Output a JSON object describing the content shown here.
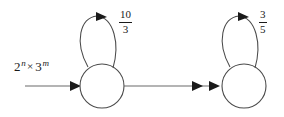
{
  "diagram": {
    "type": "state-transition-diagram",
    "background_color": "#ffffff",
    "stroke_color": "#3a3a3a",
    "text_color": "#1a1a1a",
    "input": {
      "label_base_1": "2",
      "label_sup_1": "n",
      "label_times": "×",
      "label_base_2": "3",
      "label_sup_2": "m",
      "label_plain": "2^n × 3^m"
    },
    "states": [
      {
        "id": "state-left",
        "label": "",
        "cx": 102,
        "cy": 86,
        "r": 22,
        "self_loop_label_numerator": "10",
        "self_loop_label_denominator": "3",
        "self_loop_label_plain": "10/3"
      },
      {
        "id": "state-right",
        "label": "",
        "cx": 244,
        "cy": 86,
        "r": 22,
        "self_loop_label_numerator": "3",
        "self_loop_label_denominator": "5",
        "self_loop_label_plain": "3/5"
      }
    ],
    "edges": [
      {
        "id": "edge-input",
        "from": "",
        "to": "state-left",
        "label": "2^n × 3^m",
        "arrowheads": 1
      },
      {
        "id": "edge-left-to-right",
        "from": "state-left",
        "to": "state-right",
        "label": "",
        "arrowheads": 2
      },
      {
        "id": "self-loop-left",
        "from": "state-left",
        "to": "state-left",
        "label": "10/3",
        "arrowheads": 1
      },
      {
        "id": "self-loop-right",
        "from": "state-right",
        "to": "state-right",
        "label": "3/5",
        "arrowheads": 1
      }
    ]
  }
}
